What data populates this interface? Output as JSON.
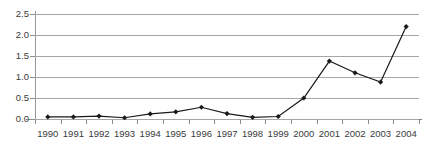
{
  "chart_data": {
    "type": "line",
    "title": "",
    "subtitle": "",
    "xlabel": "",
    "ylabel": "",
    "categories": [
      "1990",
      "1991",
      "1992",
      "1993",
      "1994",
      "1995",
      "1996",
      "1997",
      "1998",
      "1999",
      "2000",
      "2001",
      "2002",
      "2003",
      "2004"
    ],
    "values": [
      0.05,
      0.05,
      0.07,
      0.03,
      0.12,
      0.17,
      0.28,
      0.13,
      0.04,
      0.06,
      0.5,
      1.38,
      1.1,
      0.88,
      2.2
    ],
    "series": [
      {
        "name": "",
        "values": [
          0.05,
          0.05,
          0.07,
          0.03,
          0.12,
          0.17,
          0.28,
          0.13,
          0.04,
          0.06,
          0.5,
          1.38,
          1.1,
          0.88,
          2.2
        ]
      }
    ],
    "ylim": [
      0.0,
      2.5
    ],
    "ytick_values": [
      0.0,
      0.5,
      1.0,
      1.5,
      2.0,
      2.5
    ],
    "ytick_labels": [
      "0.0",
      "0.5",
      "1.0",
      "1.5",
      "2.0",
      "2.5"
    ],
    "grid": true,
    "grid_axis": "y",
    "legend": false,
    "legend_position": "none",
    "marker": "diamond",
    "line_color": "#1a1a1a",
    "marker_color": "#1a1a1a",
    "grid_color": "#a6a6a6",
    "axis_color": "#8d8d8d",
    "background_color": "#ffffff",
    "text_color": "#3a3a3a"
  }
}
